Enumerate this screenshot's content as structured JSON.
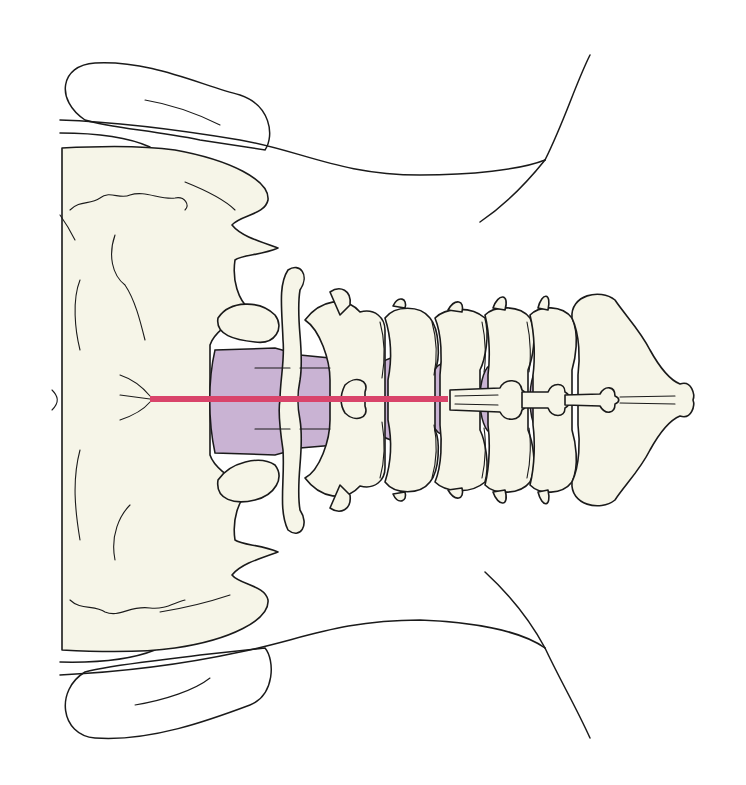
{
  "figure": {
    "colors": {
      "background": "#ffffff",
      "bone": "#f6f5e8",
      "ink": "#1a1a1a",
      "dura": "#c9b3d3",
      "needle": "#d9446a"
    },
    "needle": {
      "x1": 150,
      "y1": 399,
      "x2": 448,
      "y2": 399
    },
    "regions": [
      "occiput",
      "mastoid-left",
      "mastoid-right",
      "cervical-vertebrae",
      "dural-sac",
      "spinous-processes",
      "needle"
    ]
  }
}
